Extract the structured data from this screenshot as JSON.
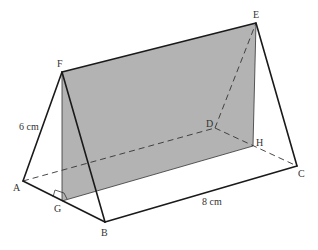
{
  "figure": {
    "shade_color": "#b3b3b3",
    "edge_color": "#1a1a1a",
    "background": "#ffffff"
  },
  "vertices": {
    "A": {
      "label": "A",
      "x": 23,
      "y": 181
    },
    "B": {
      "label": "B",
      "x": 105,
      "y": 222
    },
    "C": {
      "label": "C",
      "x": 297,
      "y": 166
    },
    "D": {
      "label": "D",
      "x": 215,
      "y": 128
    },
    "E": {
      "label": "E",
      "x": 256,
      "y": 23
    },
    "F": {
      "label": "F",
      "x": 62,
      "y": 72
    },
    "G": {
      "label": "G",
      "x": 62,
      "y": 201
    },
    "H": {
      "label": "H",
      "x": 253,
      "y": 146
    }
  },
  "measurements": {
    "af_length": "6 cm",
    "bc_length": "8 cm"
  }
}
